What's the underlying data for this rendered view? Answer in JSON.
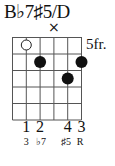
{
  "chord": {
    "name": "B♭7♯5/D",
    "start_fret_label": "5fr.",
    "muted_marker": "×",
    "strings": 6,
    "frets_shown": 5,
    "open_strings": [
      2
    ],
    "muted_strings": [
      4
    ],
    "dots": [
      {
        "string": 3,
        "fret": 2
      },
      {
        "string": 6,
        "fret": 2
      },
      {
        "string": 5,
        "fret": 3
      }
    ],
    "fingers": [
      {
        "string": 2,
        "label": "1"
      },
      {
        "string": 3,
        "label": "2"
      },
      {
        "string": 5,
        "label": "4"
      },
      {
        "string": 6,
        "label": "3"
      }
    ],
    "intervals": [
      {
        "string": 2,
        "label": "3"
      },
      {
        "string": 3,
        "label": "♭7"
      },
      {
        "string": 5,
        "label": "♯5"
      },
      {
        "string": 6,
        "label": "R"
      }
    ]
  }
}
